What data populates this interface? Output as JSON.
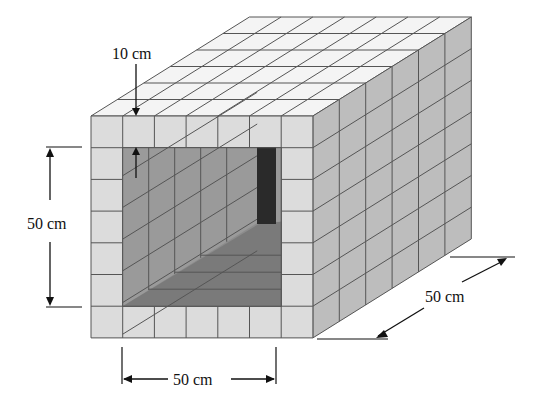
{
  "diagram": {
    "type": "hollow-box-of-cubes",
    "front_face": {
      "cols": 7,
      "rows": 7,
      "opening_cols": 5,
      "opening_rows": 5
    },
    "depth_cubes": 6,
    "labels": {
      "wall_thickness": "10 cm",
      "inner_height": "50 cm",
      "inner_width": "50 cm",
      "depth": "50 cm"
    },
    "colors": {
      "front_face": "#dcdcdc",
      "top_face": "#f4f4f4",
      "right_face": "#bdbdbd",
      "inner_left_wall": "#9a9a9a",
      "inner_back": "#8c8c8c",
      "inner_floor": "#7a7a7a",
      "dark_slot": "#2a2a2a",
      "grid_line": "#555555"
    }
  }
}
